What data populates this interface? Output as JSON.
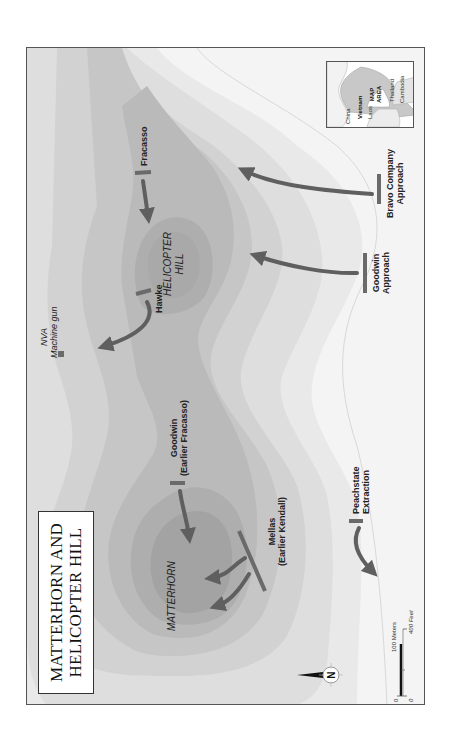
{
  "title": {
    "line1": "MATTERHORN AND",
    "line2": "HELICOPTER HILL"
  },
  "terrain_labels": {
    "matterhorn": "MATTERHORN",
    "helicopter_hill_line1": "HELICOPTER",
    "helicopter_hill_line2": "HILL"
  },
  "positions": {
    "nva_line1": "NVA",
    "nva_line2": "Machine gun",
    "hawke": "Hawke",
    "fracasso": "Fracasso",
    "goodwin_line1": "Goodwin",
    "goodwin_line2": "(Earlier Fracasso)",
    "mellas_line1": "Mellas",
    "mellas_line2": "(Earlier Kendall)",
    "peachstate_line1": "Peachstate",
    "peachstate_line2": "Extraction",
    "goodwin_approach_line1": "Goodwin",
    "goodwin_approach_line2": "Approach",
    "bravo_line1": "Bravo Company",
    "bravo_line2": "Approach"
  },
  "inset": {
    "china": "China",
    "vietnam": "Vietnam",
    "laos": "Laos",
    "thailand": "Thailand",
    "cambodia": "Cambodia",
    "map_area_line1": "MAP",
    "map_area_line2": "AREA"
  },
  "north_arrow": {
    "letter": "N"
  },
  "scale": {
    "meters_zero": "0",
    "meters_label": "100 Meters",
    "feet_zero": "0",
    "feet_label": "400 Feet"
  },
  "colors": {
    "arrow": "#5f5f5f",
    "position_bar": "#6a6a6a",
    "terrain_levels": [
      "#f4f4f4",
      "#e9e9e9",
      "#dedede",
      "#d2d2d2",
      "#c6c6c6",
      "#bababa",
      "#aeaeae",
      "#a3a3a3"
    ],
    "frame": "#555555",
    "inset_highlight": "#c8c8c8"
  }
}
